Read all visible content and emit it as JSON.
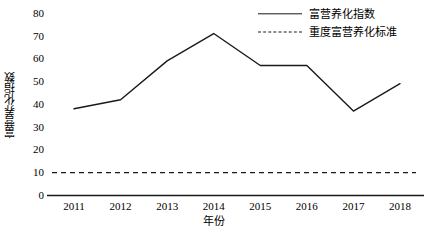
{
  "chart_data": {
    "type": "line",
    "title": "",
    "xlabel": "年份",
    "ylabel": "富营养化指数",
    "categories": [
      "2011",
      "2012",
      "2013",
      "2014",
      "2015",
      "2016",
      "2017",
      "2018"
    ],
    "series": [
      {
        "name": "富营养化指数",
        "style": "solid",
        "color": "#1a1a1a",
        "values": [
          38,
          42,
          59,
          71,
          57,
          57,
          37,
          49
        ]
      },
      {
        "name": "重度富营养化标准",
        "style": "dashed",
        "color": "#1a1a1a",
        "values": [
          10,
          10,
          10,
          10,
          10,
          10,
          10,
          10
        ]
      }
    ],
    "ylim": [
      0,
      80
    ],
    "ytick_values": [
      "80",
      "70",
      "60",
      "50",
      "40",
      "30",
      "20",
      "10",
      "0"
    ],
    "ytick_step": 10,
    "grid": false,
    "legend_position": "top-right"
  },
  "legend": {
    "items": [
      {
        "label": "富营养化指数",
        "style": "solid"
      },
      {
        "label": "重度富营养化标准",
        "style": "dashed"
      }
    ]
  },
  "axes": {
    "y_label": "富营养化指数",
    "x_label": "年份",
    "y_ticks": [
      "80",
      "70",
      "60",
      "50",
      "40",
      "30",
      "20",
      "10",
      "0"
    ],
    "x_ticks": [
      "2011",
      "2012",
      "2013",
      "2014",
      "2015",
      "2016",
      "2017",
      "2018"
    ]
  }
}
